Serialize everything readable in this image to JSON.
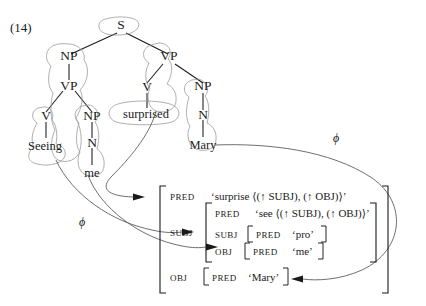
{
  "figure": {
    "example_number": "(14)",
    "correspondence_symbol_1": "ϕ",
    "correspondence_symbol_2": "ϕ",
    "ink_color": "#1a1a1a",
    "blob_color": "#9a9a9a",
    "curve_color": "#555555",
    "background_color": "#ffffff"
  },
  "c_structure": {
    "nodes": [
      {
        "id": "S",
        "label": "S"
      },
      {
        "id": "NP1",
        "label": "NP"
      },
      {
        "id": "VP1",
        "label": "VP"
      },
      {
        "id": "V1",
        "label": "V"
      },
      {
        "id": "NP2",
        "label": "NP"
      },
      {
        "id": "N1",
        "label": "N"
      },
      {
        "id": "VP2",
        "label": "VP"
      },
      {
        "id": "V2",
        "label": "V"
      },
      {
        "id": "NP3",
        "label": "NP"
      },
      {
        "id": "N2",
        "label": "N"
      }
    ],
    "leaves": [
      {
        "id": "L1",
        "label": "Seeing"
      },
      {
        "id": "L2",
        "label": "me"
      },
      {
        "id": "L3",
        "label": "surprised"
      },
      {
        "id": "L4",
        "label": "Mary"
      }
    ]
  },
  "f_structure": {
    "rows": [
      {
        "attribute": "PRED",
        "value": "‘surprise ⟨(↑ SUBJ), (↑ OBJ)⟩’"
      },
      {
        "attribute": "SUBJ",
        "nested": {
          "rows": [
            {
              "attribute": "PRED",
              "value": "‘see ⟨(↑ SUBJ), (↑ OBJ)⟩’"
            },
            {
              "attribute": "SUBJ",
              "nested": {
                "rows": [
                  {
                    "attribute": "PRED",
                    "value": "‘pro’"
                  }
                ]
              }
            },
            {
              "attribute": "OBJ",
              "nested": {
                "rows": [
                  {
                    "attribute": "PRED",
                    "value": "‘me’"
                  }
                ]
              }
            }
          ]
        }
      },
      {
        "attribute": "OBJ",
        "nested": {
          "rows": [
            {
              "attribute": "PRED",
              "value": "‘Mary’"
            }
          ]
        }
      }
    ]
  },
  "labels": {
    "pred_1": "PRED",
    "pred_2": "PRED",
    "pred_3": "PRED",
    "pred_4": "PRED",
    "pred_5": "PRED",
    "subj_outer": "SUBJ",
    "subj_inner": "SUBJ",
    "obj_inner": "OBJ",
    "obj_outer": "OBJ",
    "val_surprise": "‘surprise ⟨(↑ SUBJ), (↑ OBJ)⟩’",
    "val_see": "‘see ⟨(↑ SUBJ), (↑ OBJ)⟩’",
    "val_pro": "‘pro’",
    "val_me": "‘me’",
    "val_mary": "‘Mary’"
  }
}
